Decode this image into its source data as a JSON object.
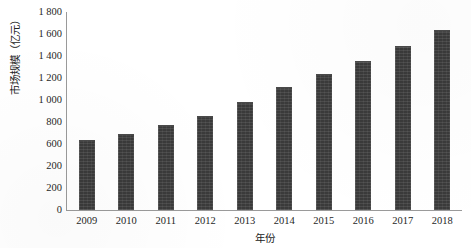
{
  "chart_data": {
    "type": "bar",
    "title": "",
    "subtitle": "",
    "xlabel": "年份",
    "ylabel": "市场规模（亿元）",
    "categories": [
      "2009",
      "2010",
      "2011",
      "2012",
      "2013",
      "2014",
      "2015",
      "2016",
      "2017",
      "2018"
    ],
    "values": [
      625,
      680,
      765,
      845,
      975,
      1105,
      1230,
      1350,
      1480,
      1625
    ],
    "series": [
      {
        "name": "市场规模",
        "values": [
          625,
          680,
          765,
          845,
          975,
          1105,
          1230,
          1350,
          1480,
          1625
        ]
      }
    ],
    "ylim": [
      0,
      1800
    ],
    "y_tick_values": [
      1800,
      1600,
      1400,
      1200,
      1000,
      800,
      600,
      400,
      200,
      0
    ],
    "y_tick_labels": [
      "1 800",
      "1 600",
      "1 400",
      "1 200",
      "1 000",
      "800",
      "600",
      "200",
      "200",
      "0"
    ],
    "grid": false,
    "legend": null,
    "legend_position": "none",
    "bar_color": "#3a3a3a",
    "axis_color": "#9a9a9a",
    "background_color": "#ffffff"
  }
}
